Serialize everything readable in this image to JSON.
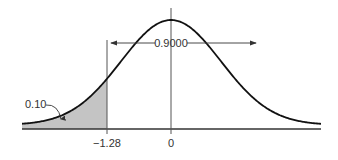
{
  "chart_data": {
    "type": "area",
    "title": "",
    "xlabel": "",
    "ylabel": "",
    "tick_labels": [
      "-1.28",
      "0"
    ],
    "x_ticks": [
      -1.28,
      0
    ],
    "shaded_region": {
      "from": "-inf",
      "to": -1.28,
      "area": 0.1
    },
    "annotations": [
      {
        "text": "0.10",
        "points_to": "shaded left tail"
      },
      {
        "text": "0.9000",
        "spans": [
          -1.28,
          "+inf"
        ]
      }
    ],
    "grid": false,
    "legend": null
  },
  "labels": {
    "tail_area": "0.10",
    "right_area": "0.9000",
    "tick_z": "−1.28",
    "tick_zero": "0"
  },
  "colors": {
    "shade": "#c4c4c4",
    "curve": "#111111",
    "axis": "#333333"
  }
}
